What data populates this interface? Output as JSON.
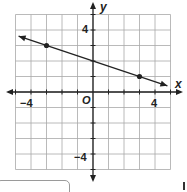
{
  "chart_data": {
    "type": "line",
    "title": "",
    "xlabel": "x",
    "ylabel": "y",
    "xlim": [
      -5,
      5
    ],
    "ylim": [
      -5,
      5
    ],
    "grid": true,
    "x_ticks_labeled": [
      -4,
      4
    ],
    "y_ticks_labeled": [
      4,
      -4
    ],
    "origin_label": "O",
    "series": [
      {
        "name": "line",
        "points": [
          [
            -3,
            3
          ],
          [
            3,
            1
          ]
        ],
        "y_intercept": 2,
        "slope": -0.3333,
        "extends_both_directions": true,
        "plotted_endpoints": [
          [
            -4.8,
            3.6
          ],
          [
            4.8,
            0.4
          ]
        ]
      }
    ]
  },
  "labels": {
    "x_axis": "x",
    "y_axis": "y",
    "origin": "O",
    "x_neg4": "−4",
    "x_pos4": "4",
    "y_pos4": "4",
    "y_neg4": "−4"
  },
  "colors": {
    "grid": "#a8a8a8",
    "ink": "#222222"
  }
}
